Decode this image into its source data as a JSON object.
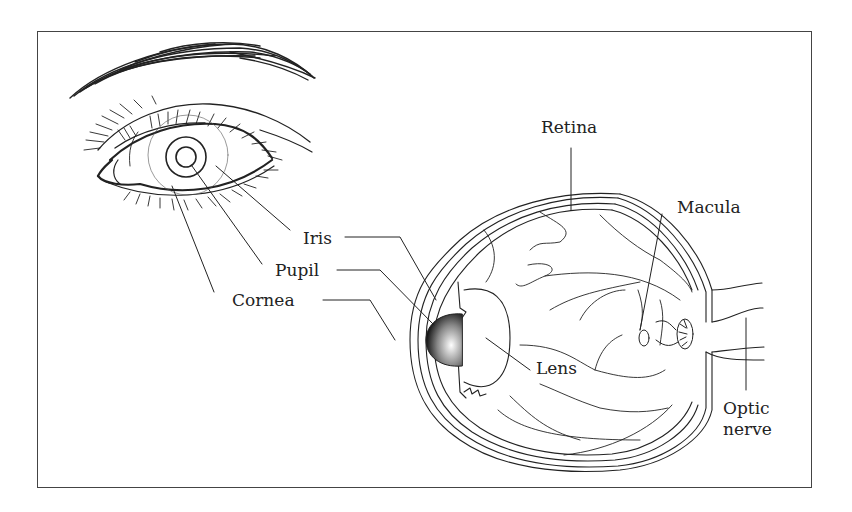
{
  "diagram": {
    "type": "anatomy-of-the-eye",
    "views": [
      "external-eye",
      "eyeball-cross-section"
    ],
    "labels": {
      "iris": "Iris",
      "pupil": "Pupil",
      "cornea": "Cornea",
      "retina": "Retina",
      "macula": "Macula",
      "lens": "Lens",
      "optic_nerve_line1": "Optic",
      "optic_nerve_line2": "nerve"
    },
    "colors": {
      "line": "#222222",
      "frame": "#444444",
      "background": "#ffffff"
    }
  }
}
